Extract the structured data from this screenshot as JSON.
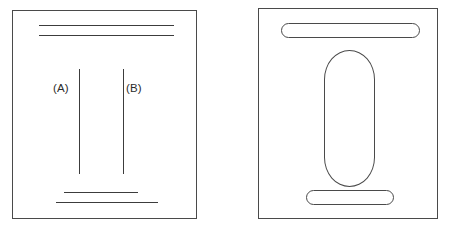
{
  "figure": {
    "kind": "two-panel-line-drawing",
    "background_color": "#ffffff",
    "stroke_color": "#4a4a4a",
    "width": 451,
    "height": 233
  },
  "panels": [
    {
      "id": "panel-left",
      "name": "left-panel",
      "labels": [
        {
          "id": "label-a",
          "text": "(A)"
        },
        {
          "id": "label-b",
          "text": "(B)"
        }
      ],
      "strokes": {
        "top_lines": 2,
        "bottom_lines": 2,
        "vertical_lines": 2
      }
    },
    {
      "id": "panel-right",
      "name": "right-panel",
      "shapes": {
        "top_capsule": "horizontal-capsule",
        "center_capsule": "vertical-capsule",
        "bottom_capsule": "horizontal-capsule"
      }
    }
  ]
}
